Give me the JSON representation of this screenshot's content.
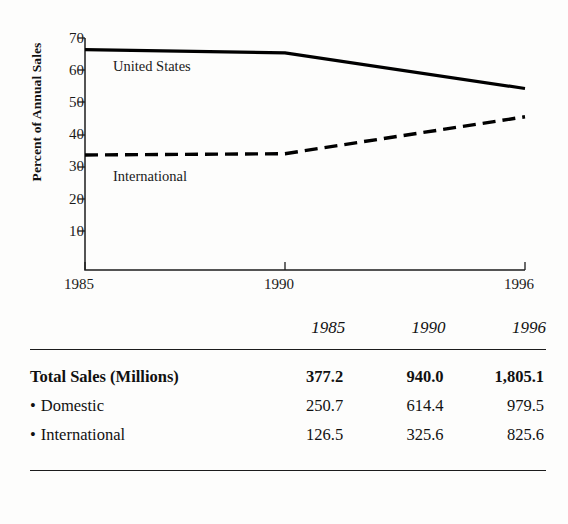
{
  "chart_data": {
    "type": "line",
    "title": "",
    "xlabel": "",
    "ylabel": "Percent of Annual Sales",
    "x": [
      1985,
      1990,
      1996
    ],
    "xtick_labels": [
      "1985",
      "1990",
      "1996"
    ],
    "ytick_labels": [
      "10",
      "20",
      "30",
      "40",
      "50",
      "60",
      "70"
    ],
    "yticks": [
      10,
      20,
      30,
      40,
      50,
      60,
      70
    ],
    "ylim": [
      0,
      70
    ],
    "xlim": [
      1985,
      1996
    ],
    "grid": false,
    "legend_position": "inline-labels",
    "series": [
      {
        "name": "United States",
        "style": "solid",
        "color": "#000000",
        "values": [
          66.4,
          65.4,
          54.3
        ]
      },
      {
        "name": "International",
        "style": "dashed",
        "color": "#000000",
        "values": [
          33.6,
          34.0,
          45.5
        ]
      }
    ],
    "annotations": [
      {
        "text": "United States",
        "x": 1985.9,
        "y": 60.5
      },
      {
        "text": "International",
        "x": 1985.9,
        "y": 29.5
      }
    ]
  },
  "table": {
    "columns": [
      "",
      "1985",
      "1990",
      "1996"
    ],
    "year_headers": [
      "1985",
      "1990",
      "1996"
    ],
    "rows": [
      {
        "label": "Total Sales (Millions)",
        "bullet": false,
        "bold": true,
        "values": [
          "377.2",
          "940.0",
          "1,805.1"
        ]
      },
      {
        "label": "Domestic",
        "bullet": true,
        "bold": false,
        "values": [
          "250.7",
          "614.4",
          "979.5"
        ]
      },
      {
        "label": "International",
        "bullet": true,
        "bold": false,
        "values": [
          "126.5",
          "325.6",
          "825.6"
        ]
      }
    ],
    "bullet_glyph": "•"
  },
  "colors": {
    "ink": "#111111",
    "rule": "#1c1c1c",
    "background": "#fdfdfc"
  }
}
